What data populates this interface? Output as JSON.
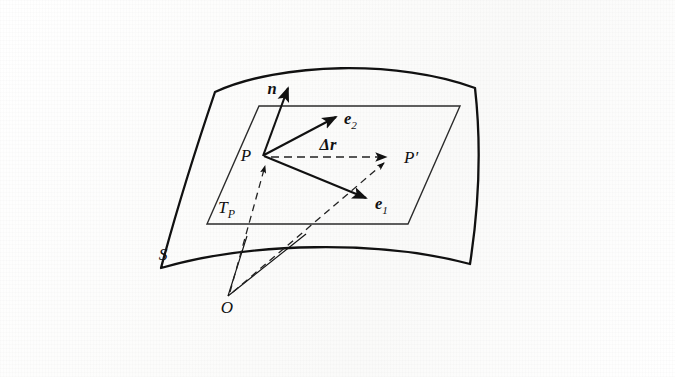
{
  "figure": {
    "background_color": "#fdfdfd",
    "ink_color": "#111111",
    "width": 675,
    "height": 377
  },
  "labels": {
    "surface": "S",
    "tangent_plane_base": "T",
    "tangent_plane_sub": "P",
    "point_p": "P",
    "point_p_prime": "P′",
    "origin": "O",
    "normal_vector": "n",
    "basis_vector_1_base": "e",
    "basis_vector_1_sub": "1",
    "basis_vector_2_base": "e",
    "basis_vector_2_sub": "2",
    "displacement_base": "Δr"
  },
  "geometry": {
    "surface_patch": {
      "name": "S",
      "description": "curved quadrilateral surface patch",
      "corners": [
        [
          215,
          92
        ],
        [
          475,
          88
        ],
        [
          470,
          264
        ],
        [
          161,
          268
        ]
      ],
      "stroke_width": 2.2
    },
    "tangent_plane": {
      "name": "T_P",
      "description": "parallelogram representing the tangent plane at P",
      "corners": [
        [
          259,
          106
        ],
        [
          460,
          106
        ],
        [
          408,
          224
        ],
        [
          207,
          224
        ]
      ],
      "stroke_width": 1.3
    },
    "points": {
      "P": [
        263,
        155
      ],
      "P_prime": [
        390,
        157
      ],
      "O": [
        228,
        296
      ]
    },
    "vectors": [
      {
        "name": "n",
        "from": [
          263,
          155
        ],
        "to": [
          290,
          86
        ],
        "style": "solid",
        "label_at": [
          272,
          92
        ]
      },
      {
        "name": "e2",
        "from": [
          263,
          155
        ],
        "to": [
          335,
          118
        ],
        "style": "solid",
        "label_at": [
          344,
          124
        ]
      },
      {
        "name": "e1",
        "from": [
          263,
          155
        ],
        "to": [
          365,
          198
        ],
        "style": "solid",
        "label_at": [
          376,
          210
        ]
      },
      {
        "name": "dr",
        "from": [
          272,
          157
        ],
        "to": [
          384,
          157
        ],
        "style": "dashed",
        "label_at": [
          327,
          147
        ]
      }
    ],
    "position_vectors": [
      {
        "name": "r(P)",
        "from": [
          228,
          296
        ],
        "to": [
          266,
          163
        ],
        "style": "dashed"
      },
      {
        "name": "r(P')",
        "from": [
          228,
          296
        ],
        "to": [
          385,
          162
        ],
        "style": "dashed"
      }
    ],
    "rulings": [
      {
        "name": "O-to-surface-left",
        "from": [
          228,
          296
        ],
        "to": [
          247,
          240
        ]
      },
      {
        "name": "O-to-surface-right",
        "from": [
          228,
          296
        ],
        "to": [
          305,
          236
        ]
      }
    ]
  }
}
